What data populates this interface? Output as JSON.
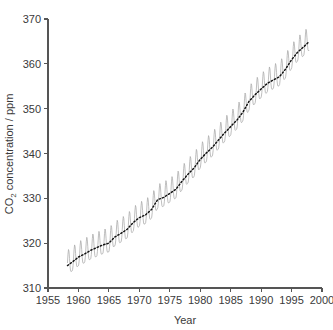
{
  "chart_data": {
    "type": "line",
    "title": "",
    "subtitle": "",
    "xlabel": "Year",
    "ylabel": "CO2 concentration / ppm",
    "ylabel_display": "CO₂ concentration / ppm",
    "xlim": [
      1955,
      2000
    ],
    "ylim": [
      310,
      370
    ],
    "xticks": [
      1955,
      1960,
      1965,
      1970,
      1975,
      1980,
      1985,
      1990,
      1995,
      2000
    ],
    "yticks": [
      310,
      320,
      330,
      340,
      350,
      360,
      370
    ],
    "xtick_labels": [
      "1955",
      "1960",
      "1965",
      "1970",
      "1975",
      "1980",
      "1985",
      "1990",
      "1995",
      "2000"
    ],
    "ytick_labels": [
      "310",
      "320",
      "330",
      "340",
      "350",
      "360",
      "370"
    ],
    "grid": false,
    "legend": null,
    "legend_position": "none",
    "annotations": [],
    "colors": {
      "seasonal": "#a8a8a8",
      "trend": "#111111",
      "axis": "#555555",
      "text": "#3a3a3a",
      "background": "#ffffff"
    },
    "series": [
      {
        "name": "Monthly mean CO2 (seasonal cycle)",
        "style": "solid-thin-gray",
        "seasonal_amplitude_ppm": 3.0,
        "peak_month": 5,
        "trough_month": 10,
        "x_start": 1958.2,
        "x_end": 1997.9
      },
      {
        "name": "Annual trend (smoothed)",
        "style": "black-dotted",
        "x": [
          1958.2,
          1959,
          1960,
          1961,
          1962,
          1963,
          1964,
          1965,
          1966,
          1967,
          1968,
          1969,
          1970,
          1971,
          1972,
          1973,
          1974,
          1975,
          1976,
          1977,
          1978,
          1979,
          1980,
          1981,
          1982,
          1983,
          1984,
          1985,
          1986,
          1987,
          1988,
          1989,
          1990,
          1991,
          1992,
          1993,
          1994,
          1995,
          1996,
          1997,
          1997.9
        ],
        "values": [
          315.0,
          315.8,
          316.9,
          317.6,
          318.4,
          319.0,
          319.6,
          320.0,
          321.4,
          322.2,
          323.1,
          324.6,
          325.7,
          326.3,
          327.5,
          329.7,
          330.2,
          331.1,
          332.0,
          333.8,
          335.4,
          336.8,
          338.7,
          340.1,
          341.4,
          343.0,
          344.6,
          346.0,
          347.4,
          349.2,
          351.6,
          353.1,
          354.4,
          355.6,
          356.4,
          357.1,
          358.8,
          360.9,
          362.6,
          363.8,
          365.0
        ],
        "units": "ppm"
      }
    ]
  },
  "axis_titles": {
    "x": "Year",
    "y": "CO₂ concentration / ppm"
  }
}
